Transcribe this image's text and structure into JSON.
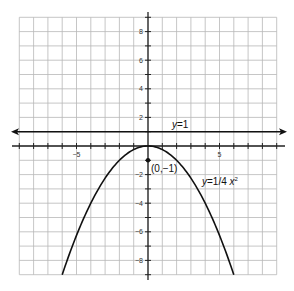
{
  "chart_data": {
    "type": "line",
    "title": "",
    "xlabel": "",
    "ylabel": "",
    "xlim": [
      -9,
      9
    ],
    "ylim": [
      -9,
      9
    ],
    "grid": true,
    "x_tick_labels": [
      {
        "value": -5,
        "label": "-5"
      },
      {
        "value": 5,
        "label": "5"
      }
    ],
    "y_tick_labels": [
      {
        "value": 8,
        "label": "8"
      },
      {
        "value": 6,
        "label": "6"
      },
      {
        "value": 4,
        "label": "4"
      },
      {
        "value": 2,
        "label": "2"
      },
      {
        "value": -2,
        "label": "-2"
      },
      {
        "value": -4,
        "label": "-4"
      },
      {
        "value": -6,
        "label": "-6"
      },
      {
        "value": -8,
        "label": "-8"
      }
    ],
    "series": [
      {
        "name": "parabola",
        "label": "y=1/4 x²",
        "equation": "y = -x^2/4",
        "x": [
          -6,
          -4,
          -2,
          0,
          2,
          4,
          6
        ],
        "y": [
          -9,
          -4,
          -1,
          0,
          -1,
          -4,
          -9
        ]
      },
      {
        "name": "directrix",
        "label": "y=1",
        "equation": "y = 1",
        "x": [
          -9,
          9
        ],
        "y": [
          1,
          1
        ]
      }
    ],
    "points": [
      {
        "x": 0,
        "y": -1,
        "label": "(0,−1)"
      }
    ],
    "annotations": {
      "directrix_label": "y=1",
      "parabola_label_prefix": "y=1/4 x",
      "parabola_label_exp": "2",
      "point_label": "(0,−1)"
    }
  }
}
